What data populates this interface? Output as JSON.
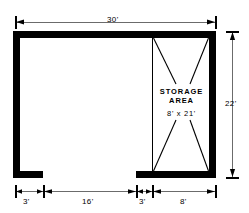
{
  "drawing": {
    "type": "architectural-floor-plan",
    "title_visible": false
  },
  "dimensions": {
    "top": {
      "label": "30'",
      "meaning": "overall-width"
    },
    "right": {
      "label": "22'",
      "meaning": "overall-depth"
    },
    "bottom_chain": [
      {
        "label": "3'",
        "meaning": "left-wall-stub"
      },
      {
        "label": "16'",
        "meaning": "open-span"
      },
      {
        "label": "3'",
        "meaning": "right-of-opening"
      },
      {
        "label": "8'",
        "meaning": "storage-area-width"
      }
    ]
  },
  "rooms": [
    {
      "name": "storage-area",
      "label_line1": "STORAGE",
      "label_line2": "AREA",
      "size_label": "8' x 21'",
      "hatch": "bowtie-diagonals"
    }
  ],
  "colors": {
    "wall": "#000000",
    "dimension_line": "#6b6b6b",
    "text": "#000000",
    "background": "#ffffff"
  }
}
